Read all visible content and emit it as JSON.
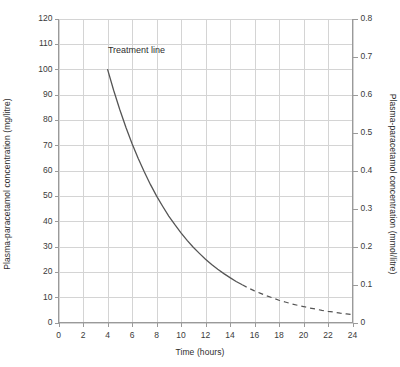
{
  "chart_data": {
    "type": "line",
    "title": "",
    "xlabel": "Time (hours)",
    "ylabel": "Plasma-paracetamol concentration (mg/litre)",
    "ylabel_right": "Plasma-paracetamol concentration (mmol/litre)",
    "xlim": [
      0,
      24
    ],
    "ylim": [
      0,
      120
    ],
    "ylim_right": [
      0,
      0.8
    ],
    "xticks": [
      "0",
      "2",
      "4",
      "6",
      "8",
      "10",
      "12",
      "14",
      "16",
      "18",
      "20",
      "22",
      "24"
    ],
    "xtick_values": [
      0,
      2,
      4,
      6,
      8,
      10,
      12,
      14,
      16,
      18,
      20,
      22,
      24
    ],
    "yticks": [
      "0",
      "10",
      "20",
      "30",
      "40",
      "50",
      "60",
      "70",
      "80",
      "90",
      "100",
      "110",
      "120"
    ],
    "ytick_values": [
      0,
      10,
      20,
      30,
      40,
      50,
      60,
      70,
      80,
      90,
      100,
      110,
      120
    ],
    "yticks_right": [
      "0",
      "0.1",
      "0.2",
      "0.3",
      "0.4",
      "0.5",
      "0.6",
      "0.7",
      "0.8"
    ],
    "ytick_right_values": [
      0,
      0.1,
      0.2,
      0.3,
      0.4,
      0.5,
      0.6,
      0.7,
      0.8
    ],
    "grid": true,
    "grid_color": "#d4d4d4",
    "axis_color": "#9a9a9a",
    "legend": [],
    "annotations": [
      {
        "text": "Treatment line",
        "x": 4.2,
        "y": 107
      }
    ],
    "series": [
      {
        "name": "Treatment line",
        "style": "solid",
        "color": "#555555",
        "x": [
          4,
          4.5,
          5,
          5.5,
          6,
          6.5,
          7,
          7.5,
          8,
          8.5,
          9,
          9.5,
          10,
          10.5,
          11,
          11.5,
          12,
          12.5,
          13,
          13.5,
          14,
          14.5,
          15
        ],
        "y": [
          100,
          91.7,
          84.1,
          77.1,
          70.7,
          64.8,
          59.5,
          54.5,
          50.0,
          45.9,
          42.0,
          38.6,
          35.4,
          32.4,
          29.7,
          27.3,
          25.0,
          22.9,
          21.0,
          19.3,
          17.7,
          16.2,
          14.9
        ]
      },
      {
        "name": "Treatment line (extrapolated)",
        "style": "dashed",
        "color": "#555555",
        "x": [
          15,
          15.5,
          16,
          16.5,
          17,
          17.5,
          18,
          18.5,
          19,
          19.5,
          20,
          20.5,
          21,
          21.5,
          22,
          22.5,
          23,
          23.5,
          24
        ],
        "y": [
          14.9,
          13.6,
          12.5,
          11.5,
          10.5,
          9.7,
          8.8,
          8.1,
          7.4,
          6.8,
          6.3,
          5.7,
          5.3,
          4.8,
          4.4,
          4.1,
          3.7,
          3.4,
          3.1
        ]
      }
    ]
  },
  "labels": {
    "left_axis_title": "Plasma-paracetamol concentration (mg/litre)",
    "right_axis_title": "Plasma-paracetamol concentration (mmol/litre)",
    "x_axis_title": "Time (hours)",
    "treatment_line_label": "Treatment line"
  }
}
